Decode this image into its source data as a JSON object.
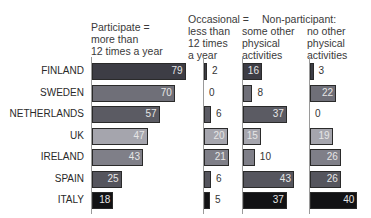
{
  "chart_data": {
    "type": "bar",
    "orientation": "horizontal",
    "title": "",
    "categories": [
      "FINLAND",
      "SWEDEN",
      "NETHERLANDS",
      "UK",
      "IRELAND",
      "SPAIN",
      "ITALY"
    ],
    "group_headers": {
      "participate": "Participate =",
      "occasional": "Occasional =",
      "non_participant": "Non-participant:"
    },
    "series": [
      {
        "name": "Participate = more than 12 times a year",
        "values": [
          79,
          70,
          57,
          47,
          43,
          25,
          18
        ]
      },
      {
        "name": "Occasional = less than 12 times a year",
        "values": [
          2,
          0,
          6,
          20,
          21,
          6,
          5
        ]
      },
      {
        "name": "Non-participant: some other physical activities",
        "values": [
          16,
          8,
          37,
          15,
          10,
          43,
          37
        ]
      },
      {
        "name": "Non-participant: no other physical activities",
        "values": [
          3,
          22,
          0,
          19,
          26,
          26,
          40
        ]
      }
    ],
    "unit": "%",
    "category_colors": [
      "#3d3d45",
      "#6f6f78",
      "#5b5b63",
      "#a5a5ad",
      "#7f7f88",
      "#55555d",
      "#121214"
    ],
    "grid": false,
    "legend": "column headers above bars"
  },
  "headers": {
    "col1": [
      "Participate =",
      "more than",
      "12 times a year"
    ],
    "col2": [
      "Occasional =",
      "less than",
      "12 times",
      "a year"
    ],
    "nonpart": "Non-participant:",
    "col3": [
      "some other",
      "physical",
      "activities"
    ],
    "col4": [
      "no other",
      "physical",
      "activities"
    ]
  }
}
